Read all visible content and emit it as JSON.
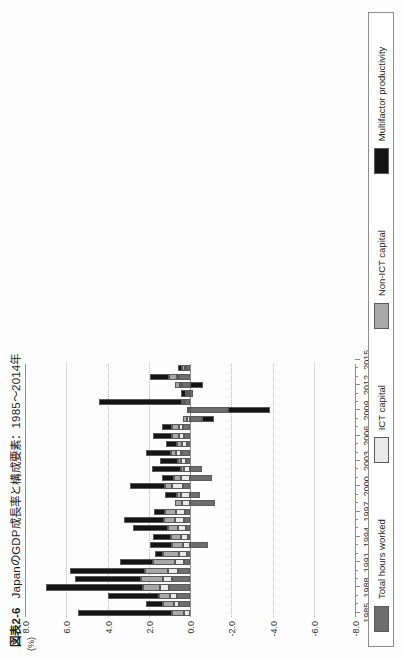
{
  "figure": {
    "number": "図表2-6",
    "title": "JapanのGDP成長率と構成要素：1985〜2014年",
    "unit_label": "(%)",
    "year_unit_label": "（年）"
  },
  "chart_data": {
    "type": "bar",
    "stacked": true,
    "orientation": "vertical",
    "xlabel": "（年）",
    "ylabel": "(%)",
    "ylim": [
      -8.0,
      8.0
    ],
    "ytick_labels": [
      "8.0",
      "6.0",
      "4.0",
      "2.0",
      "0.0",
      "-2.0",
      "-4.0",
      "-6.0",
      "-8.0"
    ],
    "ytick_values": [
      8.0,
      6.0,
      4.0,
      2.0,
      0.0,
      -2.0,
      -4.0,
      -6.0,
      -8.0
    ],
    "grid": true,
    "legend_position": "bottom",
    "xtick_labels": [
      "1985",
      "1988",
      "1991",
      "1994",
      "1997",
      "2000",
      "2003",
      "2006",
      "2009",
      "2012",
      "2015"
    ],
    "categories": [
      "1985",
      "1986",
      "1987",
      "1988",
      "1989",
      "1990",
      "1991",
      "1992",
      "1993",
      "1994",
      "1995",
      "1996",
      "1997",
      "1998",
      "1999",
      "2000",
      "2001",
      "2002",
      "2003",
      "2004",
      "2005",
      "2006",
      "2007",
      "2008",
      "2009",
      "2010",
      "2011",
      "2012",
      "2013",
      "2014"
    ],
    "series": [
      {
        "name": "Total hours worked",
        "color": "#6e6e6e",
        "values": [
          0.0,
          0.55,
          0.65,
          1.0,
          0.85,
          0.6,
          0.3,
          0.15,
          -0.85,
          0.1,
          0.2,
          0.3,
          0.25,
          -1.2,
          -0.5,
          0.35,
          -1.05,
          -0.6,
          0.2,
          0.45,
          0.15,
          0.3,
          0.35,
          -0.6,
          -1.85,
          0.25,
          -0.15,
          0.4,
          0.55,
          0.2
        ]
      },
      {
        "name": "ICT capital",
        "color": "#e9e9e9",
        "values": [
          0.3,
          0.25,
          0.3,
          0.45,
          0.45,
          0.45,
          0.45,
          0.4,
          0.35,
          0.35,
          0.4,
          0.45,
          0.45,
          0.4,
          0.45,
          0.5,
          0.45,
          0.3,
          0.25,
          0.25,
          0.25,
          0.25,
          0.2,
          0.15,
          0.1,
          0.1,
          0.1,
          0.08,
          0.08,
          0.05
        ]
      },
      {
        "name": "Non-ICT capital",
        "color": "#a8a8a8",
        "values": [
          0.55,
          0.5,
          0.55,
          0.85,
          1.1,
          1.15,
          1.05,
          0.75,
          0.5,
          0.45,
          0.45,
          0.5,
          0.5,
          0.35,
          0.2,
          0.35,
          0.35,
          0.15,
          0.15,
          0.2,
          0.25,
          0.3,
          0.3,
          0.2,
          0.05,
          0.05,
          0.1,
          0.25,
          0.4,
          0.15
        ]
      },
      {
        "name": "Multifactor productivity",
        "color": "#141414",
        "values": [
          4.6,
          0.85,
          2.5,
          4.7,
          3.2,
          3.6,
          1.6,
          0.4,
          1.1,
          0.9,
          1.7,
          1.95,
          0.55,
          0.0,
          0.55,
          1.7,
          0.55,
          1.4,
          0.85,
          1.25,
          0.5,
          0.95,
          0.5,
          -0.55,
          -2.05,
          4.0,
          0.25,
          -0.65,
          0.9,
          0.2
        ]
      }
    ]
  },
  "legend": {
    "items": [
      {
        "label": "Total hours worked",
        "color": "#6e6e6e"
      },
      {
        "label": "ICT capital",
        "color": "#e9e9e9"
      },
      {
        "label": "Non-ICT capital",
        "color": "#a8a8a8"
      },
      {
        "label": "Multifactor productivity",
        "color": "#141414"
      }
    ]
  }
}
